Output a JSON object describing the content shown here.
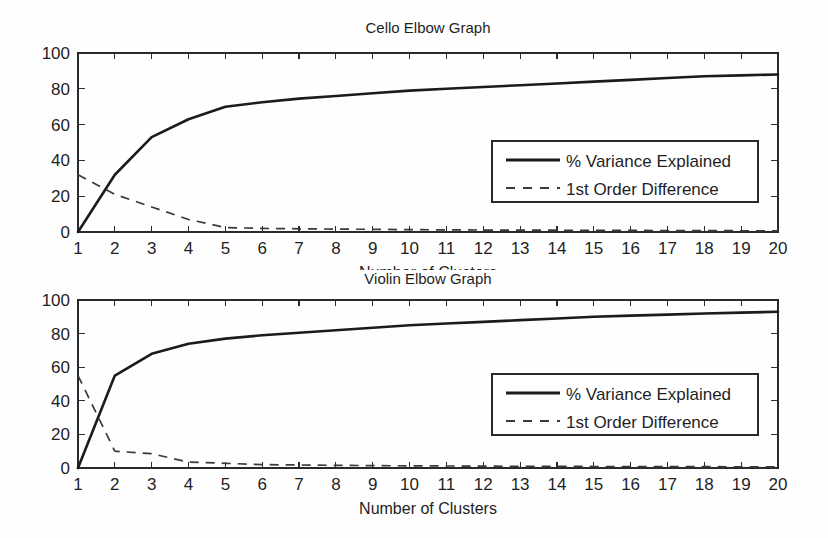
{
  "figure": {
    "background": "#fefefe",
    "ink_color": "#1b1b1b"
  },
  "chart_data": [
    {
      "type": "line",
      "id": "cello",
      "title": "Cello Elbow Graph",
      "xlabel": "Number of Clusters",
      "ylabel": "",
      "x": [
        1,
        2,
        3,
        4,
        5,
        6,
        7,
        8,
        9,
        10,
        11,
        12,
        13,
        14,
        15,
        16,
        17,
        18,
        19,
        20
      ],
      "xlim": [
        1,
        20
      ],
      "ylim": [
        0,
        100
      ],
      "xticks": [
        1,
        2,
        3,
        4,
        5,
        6,
        7,
        8,
        9,
        10,
        11,
        12,
        13,
        14,
        15,
        16,
        17,
        18,
        19,
        20
      ],
      "xtick_labels": [
        "1",
        "2",
        "3",
        "4",
        "5",
        "6",
        "7",
        "8",
        "9",
        "10",
        "11",
        "12",
        "13",
        "14",
        "15",
        "16",
        "17",
        "18",
        "19",
        "20"
      ],
      "yticks": [
        0,
        20,
        40,
        60,
        80,
        100
      ],
      "ytick_labels": [
        "0",
        "20",
        "40",
        "60",
        "80",
        "100"
      ],
      "grid": false,
      "legend_position": "center-right",
      "series": [
        {
          "name": "% Variance Explained",
          "style": "solid",
          "values": [
            0,
            32,
            53,
            63,
            70,
            72.5,
            74.5,
            76,
            77.5,
            79,
            80,
            81,
            82,
            83,
            84,
            85,
            86,
            87,
            87.5,
            88
          ]
        },
        {
          "name": "1st Order Difference",
          "style": "dashed",
          "values": [
            32,
            21,
            14,
            7,
            2.5,
            2,
            1.8,
            1.6,
            1.5,
            1.3,
            1.2,
            1.1,
            1.0,
            1.0,
            0.9,
            0.9,
            0.8,
            0.8,
            0.7,
            0.7
          ]
        }
      ]
    },
    {
      "type": "line",
      "id": "violin",
      "title": "Violin Elbow Graph",
      "xlabel": "Number of Clusters",
      "ylabel": "",
      "x": [
        1,
        2,
        3,
        4,
        5,
        6,
        7,
        8,
        9,
        10,
        11,
        12,
        13,
        14,
        15,
        16,
        17,
        18,
        19,
        20
      ],
      "xlim": [
        1,
        20
      ],
      "ylim": [
        0,
        100
      ],
      "xticks": [
        1,
        2,
        3,
        4,
        5,
        6,
        7,
        8,
        9,
        10,
        11,
        12,
        13,
        14,
        15,
        16,
        17,
        18,
        19,
        20
      ],
      "xtick_labels": [
        "1",
        "2",
        "3",
        "4",
        "5",
        "6",
        "7",
        "8",
        "9",
        "10",
        "11",
        "12",
        "13",
        "14",
        "15",
        "16",
        "17",
        "18",
        "19",
        "20"
      ],
      "yticks": [
        0,
        20,
        40,
        60,
        80,
        100
      ],
      "ytick_labels": [
        "0",
        "20",
        "40",
        "60",
        "80",
        "100"
      ],
      "grid": false,
      "legend_position": "center-right",
      "series": [
        {
          "name": "% Variance Explained",
          "style": "solid",
          "values": [
            0,
            55,
            68,
            74,
            77,
            79,
            80.5,
            82,
            83.5,
            85,
            86,
            87,
            88,
            89,
            90,
            90.7,
            91.3,
            92,
            92.5,
            93
          ]
        },
        {
          "name": "1st Order Difference",
          "style": "dashed",
          "values": [
            55,
            10,
            8.5,
            3.5,
            2.8,
            2,
            1.8,
            1.6,
            1.4,
            1.3,
            1.2,
            1.1,
            1.0,
            1.0,
            0.9,
            0.9,
            0.8,
            0.8,
            0.7,
            0.7
          ]
        }
      ]
    }
  ],
  "legend": {
    "entries": [
      {
        "label": "% Variance Explained",
        "style": "solid"
      },
      {
        "label": "1st Order Difference",
        "style": "dashed"
      }
    ]
  }
}
